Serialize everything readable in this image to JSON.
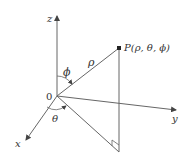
{
  "diagram": {
    "type": "spherical-coordinates",
    "labels": {
      "z_axis": "z",
      "x_axis": "x",
      "y_axis": "y",
      "origin": "0",
      "rho": "ρ",
      "phi": "ϕ",
      "theta": "θ",
      "point": "P(ρ, θ, ϕ)"
    },
    "colors": {
      "line": "#555555",
      "text": "#333333"
    }
  }
}
